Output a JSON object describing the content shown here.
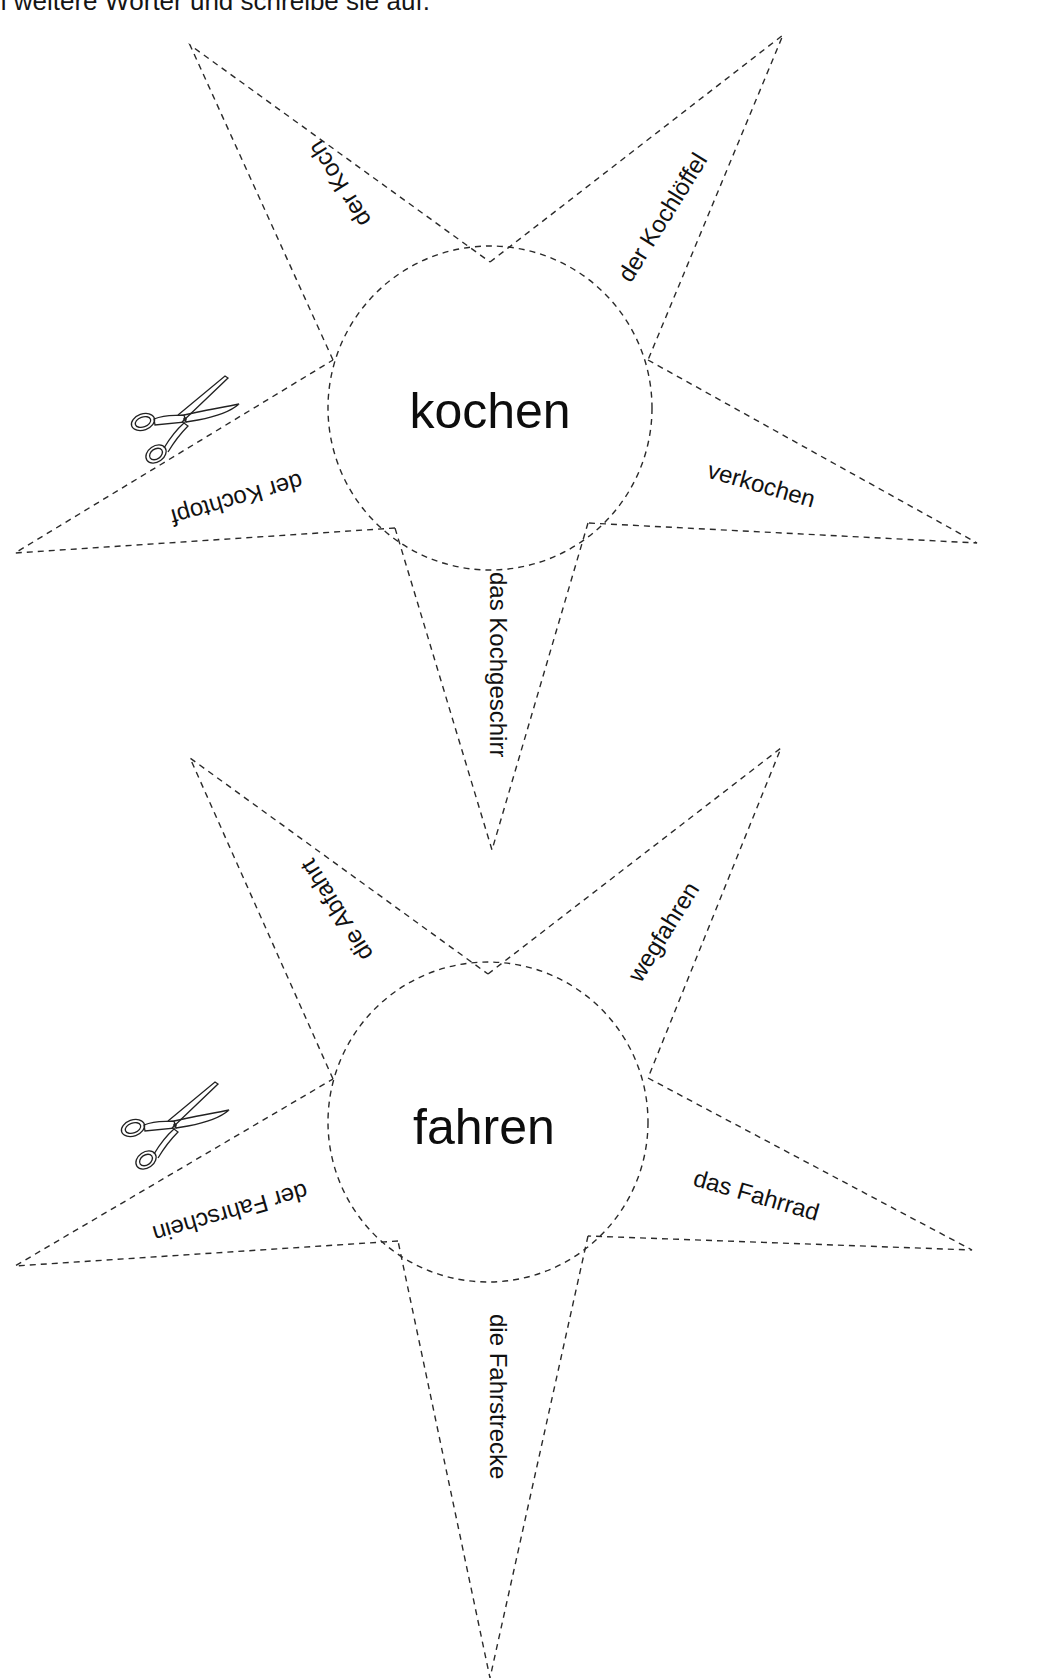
{
  "instruction": "n weitere Wörter und schreibe sie auf.",
  "stars": [
    {
      "center_word": "kochen",
      "rays": {
        "top_left": "der Koch",
        "top_right": "der Kochlöffel",
        "right": "verkochen",
        "bottom": "das Kochgeschirr",
        "left": "der Kochtopf"
      },
      "icon": "scissors-icon"
    },
    {
      "center_word": "fahren",
      "rays": {
        "top_left": "die Abfahrt",
        "top_right": "wegfahren",
        "right": "das Fahrrad",
        "bottom": "die Fahrstrecke",
        "left": "der Fahrschein"
      },
      "icon": "scissors-icon"
    }
  ],
  "colors": {
    "line": "#2a2a2a",
    "text": "#111111",
    "background": "#ffffff"
  }
}
